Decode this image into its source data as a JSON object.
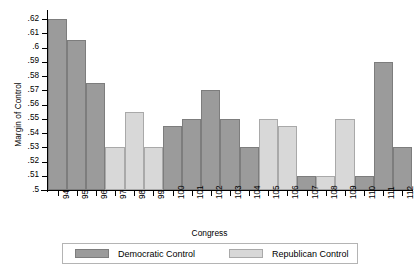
{
  "chart_data": {
    "type": "bar",
    "title": "",
    "xlabel": "Congress",
    "ylabel": "Margin of Control",
    "ylim": [
      0.5,
      0.625
    ],
    "ytick_values": [
      0.5,
      0.51,
      0.52,
      0.53,
      0.54,
      0.55,
      0.56,
      0.57,
      0.58,
      0.59,
      0.6,
      0.61,
      0.62
    ],
    "ytick_labels": [
      ".5",
      ".51",
      ".52",
      ".53",
      ".54",
      ".55",
      ".56",
      ".57",
      ".58",
      ".59",
      ".6",
      ".61",
      ".62"
    ],
    "grid": false,
    "legend_position": "bottom",
    "categories": [
      "94",
      "95",
      "96",
      "97",
      "98",
      "99",
      "100",
      "101",
      "102",
      "103",
      "104",
      "105",
      "106",
      "107",
      "108",
      "109",
      "110",
      "111",
      "112"
    ],
    "values": [
      0.62,
      0.605,
      0.575,
      0.53,
      0.555,
      0.53,
      0.545,
      0.55,
      0.57,
      0.55,
      0.53,
      0.55,
      0.545,
      0.51,
      0.51,
      0.55,
      0.51,
      0.59,
      0.53
    ],
    "control": [
      "dem",
      "dem",
      "dem",
      "rep",
      "rep",
      "rep",
      "dem",
      "dem",
      "dem",
      "dem",
      "dem",
      "rep",
      "rep",
      "dem",
      "rep",
      "rep",
      "dem",
      "dem",
      "dem"
    ],
    "series": [
      {
        "name": "Democratic Control",
        "key": "dem",
        "color": "#9b9b9b",
        "points": [
          {
            "x": "94",
            "y": 0.62
          },
          {
            "x": "95",
            "y": 0.605
          },
          {
            "x": "96",
            "y": 0.575
          },
          {
            "x": "100",
            "y": 0.545
          },
          {
            "x": "101",
            "y": 0.55
          },
          {
            "x": "102",
            "y": 0.57
          },
          {
            "x": "103",
            "y": 0.55
          },
          {
            "x": "104",
            "y": 0.53
          },
          {
            "x": "107",
            "y": 0.51
          },
          {
            "x": "110",
            "y": 0.51
          },
          {
            "x": "111",
            "y": 0.59
          },
          {
            "x": "112",
            "y": 0.53
          }
        ]
      },
      {
        "name": "Republican Control",
        "key": "rep",
        "color": "#d8d8d8",
        "points": [
          {
            "x": "97",
            "y": 0.53
          },
          {
            "x": "98",
            "y": 0.555
          },
          {
            "x": "99",
            "y": 0.53
          },
          {
            "x": "105",
            "y": 0.55
          },
          {
            "x": "106",
            "y": 0.545
          },
          {
            "x": "108",
            "y": 0.51
          },
          {
            "x": "109",
            "y": 0.55
          }
        ]
      }
    ]
  },
  "legend": {
    "democratic_label": "Democratic Control",
    "republican_label": "Republican Control"
  },
  "colors": {
    "democratic": "#9b9b9b",
    "republican": "#d8d8d8",
    "axis": "#000000",
    "legend_border": "#b4b4b4"
  }
}
